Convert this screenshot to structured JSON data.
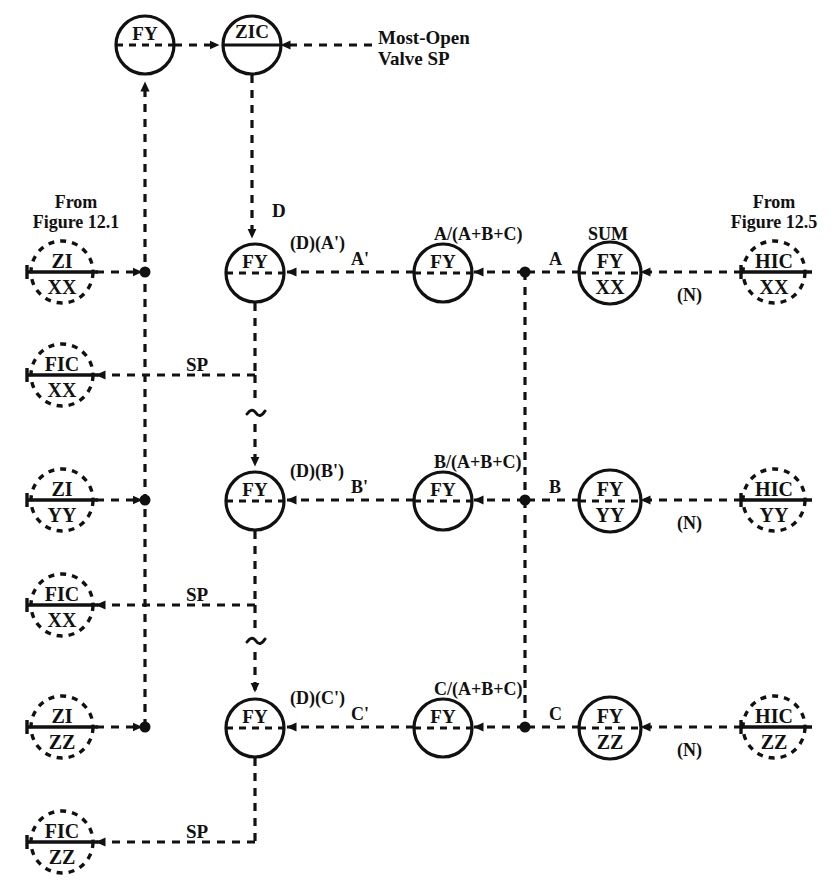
{
  "figure": {
    "line_style": "dashed signal lines",
    "colors": {
      "line": "#111111",
      "text": "#111111",
      "background": "#ffffff"
    }
  },
  "annotations": {
    "most_open_valve_sp": "Most-Open\nValve SP",
    "from_figure_12_1": "From\nFigure 12.1",
    "from_figure_12_5": "From\nFigure 12.5",
    "sum": "SUM",
    "d": "D",
    "a": "A",
    "b": "B",
    "c": "C",
    "a_prime": "A'",
    "b_prime": "B'",
    "c_prime": "C'",
    "d_a_prime": "(D)(A')",
    "d_b_prime": "(D)(B')",
    "d_c_prime": "(D)(C')",
    "ratio_a": "A/(A+B+C)",
    "ratio_b": "B/(A+B+C)",
    "ratio_c": "C/(A+B+C)",
    "n_xx": "(N)",
    "n_yy": "(N)",
    "n_zz": "(N)",
    "sp_xx": "SP",
    "sp_yy": "SP",
    "sp_zz": "SP",
    "break_1": "~",
    "break_2": "~"
  },
  "bubbles": [
    {
      "id": "fy-top",
      "top": "FY",
      "bottom": "",
      "shape": "solid-circle",
      "divider": "dashed"
    },
    {
      "id": "zic-top",
      "top": "ZIC",
      "bottom": "",
      "shape": "solid-circle",
      "divider": "solid"
    },
    {
      "id": "zi-xx",
      "top": "ZI",
      "bottom": "XX",
      "shape": "dashed-circle",
      "divider": "solid"
    },
    {
      "id": "zi-yy",
      "top": "ZI",
      "bottom": "YY",
      "shape": "dashed-circle",
      "divider": "solid"
    },
    {
      "id": "zi-zz",
      "top": "ZI",
      "bottom": "ZZ",
      "shape": "dashed-circle",
      "divider": "solid"
    },
    {
      "id": "fic-xx-1",
      "top": "FIC",
      "bottom": "XX",
      "shape": "dashed-circle",
      "divider": "solid"
    },
    {
      "id": "fic-xx-2",
      "top": "FIC",
      "bottom": "XX",
      "shape": "dashed-circle",
      "divider": "solid"
    },
    {
      "id": "fic-zz",
      "top": "FIC",
      "bottom": "ZZ",
      "shape": "dashed-circle",
      "divider": "solid"
    },
    {
      "id": "fy-mul-a",
      "top": "FY",
      "bottom": "",
      "shape": "solid-circle",
      "divider": "dashed"
    },
    {
      "id": "fy-mul-b",
      "top": "FY",
      "bottom": "",
      "shape": "solid-circle",
      "divider": "dashed"
    },
    {
      "id": "fy-mul-c",
      "top": "FY",
      "bottom": "",
      "shape": "solid-circle",
      "divider": "dashed"
    },
    {
      "id": "fy-rat-a",
      "top": "FY",
      "bottom": "",
      "shape": "solid-circle",
      "divider": "dashed"
    },
    {
      "id": "fy-rat-b",
      "top": "FY",
      "bottom": "",
      "shape": "solid-circle",
      "divider": "dashed"
    },
    {
      "id": "fy-rat-c",
      "top": "FY",
      "bottom": "",
      "shape": "solid-circle",
      "divider": "dashed"
    },
    {
      "id": "fy-xx",
      "top": "FY",
      "bottom": "XX",
      "shape": "solid-circle",
      "divider": "dashed"
    },
    {
      "id": "fy-yy",
      "top": "FY",
      "bottom": "YY",
      "shape": "solid-circle",
      "divider": "dashed"
    },
    {
      "id": "fy-zz",
      "top": "FY",
      "bottom": "ZZ",
      "shape": "solid-circle",
      "divider": "dashed"
    },
    {
      "id": "hic-xx",
      "top": "HIC",
      "bottom": "XX",
      "shape": "dashed-circle",
      "divider": "solid"
    },
    {
      "id": "hic-yy",
      "top": "HIC",
      "bottom": "YY",
      "shape": "dashed-circle",
      "divider": "solid"
    },
    {
      "id": "hic-zz",
      "top": "HIC",
      "bottom": "ZZ",
      "shape": "dashed-circle",
      "divider": "solid"
    }
  ]
}
